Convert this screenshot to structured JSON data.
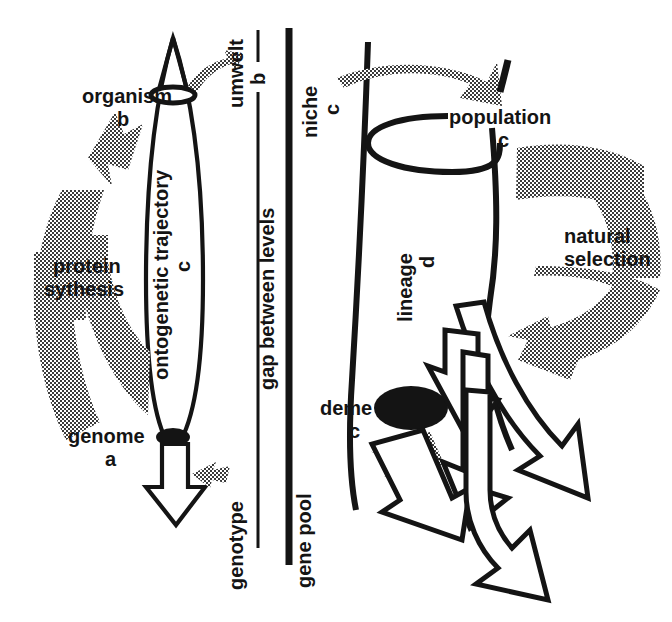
{
  "figure": {
    "background_color": "#ffffff",
    "ink_color": "#141414",
    "halftone_color": "#7a7a7a"
  },
  "left_panel": {
    "name": "organism level",
    "labels": {
      "organism": "organism",
      "organism_tag": "b",
      "ontogenetic_trajectory": "ontogenetic trajectory",
      "ontogenetic_trajectory_tag": "c",
      "genome": "genome",
      "genome_tag": "a",
      "protein_synthesis_line1": "protein",
      "protein_synthesis_line2": "sythesis"
    }
  },
  "center_axis": {
    "name": "gap between levels axis",
    "upper_label": "umwelt",
    "upper_tag": "b",
    "middle_label": "gap between levels",
    "lower_label": "genotype",
    "right_label": "gene pool"
  },
  "right_panel": {
    "name": "population level",
    "labels": {
      "niche": "niche",
      "niche_tag": "c",
      "population": "population",
      "population_tag": "c",
      "lineage": "lineage",
      "lineage_tag": "d",
      "deme": "deme",
      "deme_tag": "c",
      "natural_selection_line1": "natural",
      "natural_selection_line2": "selection"
    }
  },
  "icons": {
    "spindle": "ontogenetic-spindle-icon",
    "cone": "lineage-cone-icon",
    "genome_dot": "genome-ellipse-icon",
    "deme_dot": "deme-ellipse-icon",
    "organism_ring": "organism-ellipse-icon",
    "population_ring": "population-ellipse-icon",
    "white_arrow": "hollow-arrow-icon",
    "gray_arrow": "halftone-arrow-icon",
    "divider": "level-divider-icon"
  }
}
